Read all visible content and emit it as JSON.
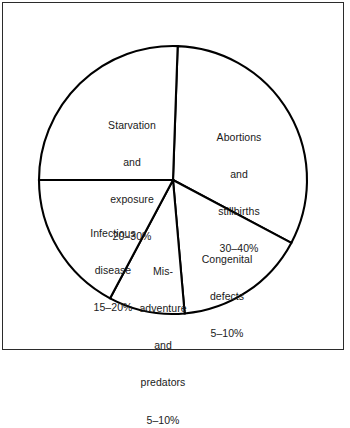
{
  "figure": {
    "background_color": "#ffffff",
    "frame_color": "#2b2b2b",
    "line_color": "#000000",
    "text_color": "#1a1a1a"
  },
  "chart_data": {
    "type": "pie",
    "title": "",
    "subtitle": "",
    "xlabel": "",
    "ylabel": "",
    "grid": false,
    "legend_position": "none",
    "labels_position": "inside-slices",
    "slice_fill": "#ffffff",
    "slice_outline": "#000000",
    "total_label": "",
    "categories": [
      "Abortions and stillbirths",
      "Congenital defects",
      "Mis-adventure and predators",
      "Infectious disease",
      "Starvation and exposure"
    ],
    "values": [
      35,
      7.5,
      7.5,
      17.5,
      25
    ],
    "range_labels": [
      "30–40%",
      "5–10%",
      "5–10%",
      "15–20%",
      "20–30%"
    ],
    "slices": [
      {
        "name": "abortions-and-stillbirths",
        "value": 35,
        "range_low": 30,
        "range_high": 40,
        "percent_label": "30–40%",
        "label_lines": [
          "Abortions",
          "and",
          "stillbirths",
          "30–40%"
        ],
        "start_angle_deg": -88,
        "end_angle_deg": 28
      },
      {
        "name": "congenital-defects",
        "value": 7.5,
        "range_low": 5,
        "range_high": 10,
        "percent_label": "5–10%",
        "label_lines": [
          "Congenital",
          "defects",
          "5–10%"
        ],
        "start_angle_deg": 28,
        "end_angle_deg": 85
      },
      {
        "name": "mis-adventure-and-predators",
        "value": 7.5,
        "range_low": 5,
        "range_high": 10,
        "percent_label": "5–10%",
        "label_lines": [
          "Mis-",
          "adventure",
          "and",
          "predators",
          "5–10%"
        ],
        "start_angle_deg": 85,
        "end_angle_deg": 118
      },
      {
        "name": "infectious-disease",
        "value": 17.5,
        "range_low": 15,
        "range_high": 20,
        "percent_label": "15–20%",
        "label_lines": [
          "Infectious",
          "disease",
          "15–20%"
        ],
        "start_angle_deg": 118,
        "end_angle_deg": 180
      },
      {
        "name": "starvation-and-exposure",
        "value": 25,
        "range_low": 20,
        "range_high": 30,
        "percent_label": "20–30%",
        "label_lines": [
          "Starvation",
          "and",
          "exposure",
          "20–30%"
        ],
        "start_angle_deg": 180,
        "end_angle_deg": 272
      }
    ],
    "geometry": {
      "center_x": 173,
      "center_y": 180,
      "radius": 134
    }
  },
  "labels": {
    "starvation": {
      "line1": "Starvation",
      "line2": "and",
      "line3": "exposure",
      "line4": "20–30%"
    },
    "abortions": {
      "line1": "Abortions",
      "line2": "and",
      "line3": "stillbirths",
      "line4": "30–40%"
    },
    "infectious": {
      "line1": "Infectious",
      "line2": "disease",
      "line3": "15–20%"
    },
    "misadventure": {
      "line1": "Mis-",
      "line2": "adventure",
      "line3": "and",
      "line4": "predators",
      "line5": "5–10%"
    },
    "congenital": {
      "line1": "Congenital",
      "line2": "defects",
      "line3": "5–10%"
    }
  }
}
